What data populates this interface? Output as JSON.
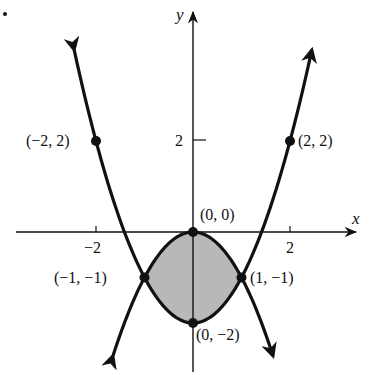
{
  "chart_data": {
    "type": "line",
    "title": "",
    "xlabel": "x",
    "ylabel": "y",
    "xlim": [
      -2.6,
      3.4
    ],
    "ylim": [
      -3.0,
      4.9
    ],
    "grid": false,
    "x_ticks": [
      {
        "value": -2,
        "label": "−2"
      },
      {
        "value": 2,
        "label": "2"
      }
    ],
    "y_ticks": [
      {
        "value": 2,
        "label": "2"
      }
    ],
    "series": [
      {
        "name": "y = x^2 - 2",
        "x_range": [
          -2.45,
          2.45
        ],
        "style": "thick black, arrows at both ends"
      },
      {
        "name": "y = -x^2",
        "x_range": [
          -1.65,
          1.65
        ],
        "style": "thick black, arrows at both ends"
      }
    ],
    "shaded_region": {
      "between": [
        "y = -x^2",
        "y = x^2 - 2"
      ],
      "x_range": [
        -1,
        1
      ],
      "color": "#b8b8b8"
    },
    "points": [
      {
        "x": -2,
        "y": 2,
        "label": "(−2, 2)"
      },
      {
        "x": 2,
        "y": 2,
        "label": "(2, 2)"
      },
      {
        "x": 0,
        "y": 0,
        "label": "(0, 0)"
      },
      {
        "x": -1,
        "y": -1,
        "label": "(−1, −1)"
      },
      {
        "x": 1,
        "y": -1,
        "label": "(1, −1)"
      },
      {
        "x": 0,
        "y": -2,
        "label": "(0, −2)"
      }
    ]
  },
  "labels": {
    "x_axis": "x",
    "y_axis": "y",
    "tick_xm2": "−2",
    "tick_x2": "2",
    "tick_y2": "2",
    "p_m2_2": "(−2, 2)",
    "p_2_2": "(2, 2)",
    "p_0_0": "(0, 0)",
    "p_m1_m1": "(−1, −1)",
    "p_1_m1": "(1, −1)",
    "p_0_m2": "(0, −2)"
  }
}
